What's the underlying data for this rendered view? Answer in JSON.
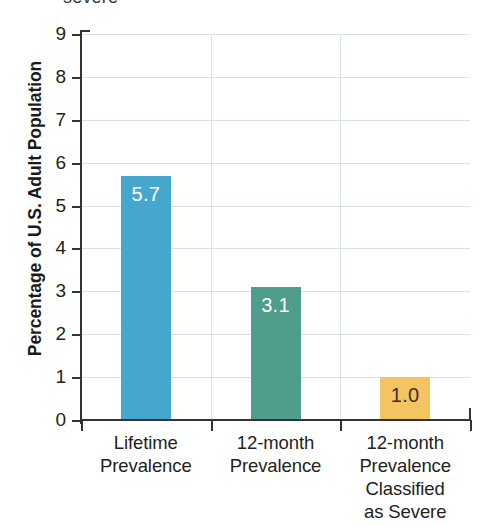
{
  "top_fragment": "severe",
  "chart_data": {
    "type": "bar",
    "title": "",
    "subtitle": "",
    "xlabel": "",
    "ylabel": "Percentage of U.S. Adult Population",
    "ylim": [
      0,
      9
    ],
    "ytick_step": 1,
    "grid": true,
    "legend": "none",
    "categories": [
      "Lifetime Prevalence",
      "12-month Prevalence",
      "12-month Prevalence Classified as Severe"
    ],
    "category_lines": [
      [
        "Lifetime",
        "Prevalence"
      ],
      [
        "12-month",
        "Prevalence"
      ],
      [
        "12-month",
        "Prevalence",
        "Classified",
        "as Severe"
      ]
    ],
    "values": [
      5.7,
      3.1,
      1.0
    ],
    "value_labels": [
      "5.7",
      "3.1",
      "1.0"
    ],
    "ytick_labels": [
      "9",
      "8",
      "7",
      "6",
      "5",
      "4",
      "3",
      "2",
      "1",
      "0"
    ],
    "bar_colors": [
      "#45a7ce",
      "#4e9d8d",
      "#f5c462"
    ],
    "value_label_colors": [
      "#ffffff",
      "#ffffff",
      "#3d3020"
    ],
    "axis_color": "#333333",
    "grid_color": "#d7e3e6"
  }
}
